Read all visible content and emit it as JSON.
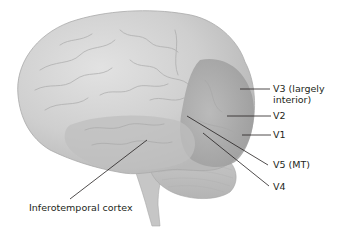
{
  "figure": {
    "colors": {
      "cortex_light": "#d4d4d4",
      "cortex_mid": "#bdbdbd",
      "visual_area": "#a9a9a9",
      "cerebellum": "#c4c4c4",
      "brainstem": "#c9c9c9",
      "leader_line": "#231f20",
      "label_text": "#231f20"
    },
    "labels": [
      {
        "id": "v3",
        "text_line1": "V3 (largely",
        "text_line2": "interior)"
      },
      {
        "id": "v2",
        "text": "V2"
      },
      {
        "id": "v1",
        "text": "V1"
      },
      {
        "id": "v5",
        "text": "V5 (MT)"
      },
      {
        "id": "v4",
        "text": "V4"
      },
      {
        "id": "it",
        "text": "Inferotemporal cortex"
      }
    ]
  }
}
